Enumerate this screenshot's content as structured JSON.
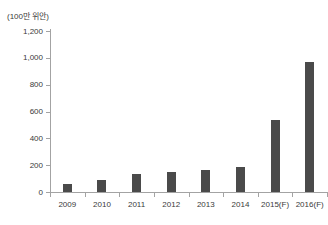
{
  "chart_data": {
    "type": "bar",
    "unit_label": "(100만 위안)",
    "categories": [
      "2009",
      "2010",
      "2011",
      "2012",
      "2013",
      "2014",
      "2015(F)",
      "2016(F)"
    ],
    "values": [
      60,
      90,
      135,
      150,
      165,
      185,
      540,
      970
    ],
    "title": "",
    "xlabel": "",
    "ylabel": "",
    "ylim": [
      0,
      1200
    ],
    "ytick_interval": 200,
    "ytick_labels": [
      "0",
      "200",
      "400",
      "600",
      "800",
      "1,000",
      "1,200"
    ],
    "grid": false,
    "legend": false,
    "bar_color": "#4a4a4a",
    "axis_color": "#a3a3a3",
    "text_color": "#3a3a3a"
  }
}
